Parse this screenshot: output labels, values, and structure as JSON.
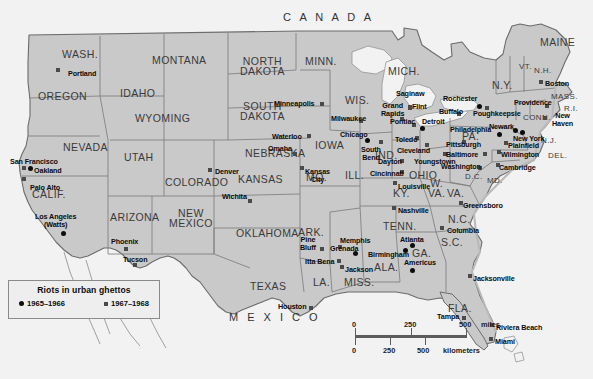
{
  "map": {
    "title": "Riots in urban ghettos",
    "width": 593,
    "height": 379,
    "background_color": "#f2f2f2",
    "land_color": "#c9c9c9",
    "water_color": "#f2f2f2",
    "border_color": "#6b6b6b",
    "countries": [
      {
        "name": "canada-label",
        "label": "C A N A D A",
        "x": 283,
        "y": 12
      },
      {
        "name": "mexico-label",
        "label": "M E X I C O",
        "x": 229,
        "y": 312
      }
    ],
    "states": [
      {
        "label": "WASH.",
        "x": 62,
        "y": 49,
        "size": "big"
      },
      {
        "label": "OREGON",
        "x": 38,
        "y": 91,
        "size": "big"
      },
      {
        "label": "IDAHO",
        "x": 120,
        "y": 88,
        "size": "big"
      },
      {
        "label": "MONTANA",
        "x": 152,
        "y": 55,
        "size": "big"
      },
      {
        "label": "NORTH\nDAKOTA",
        "x": 240,
        "y": 56,
        "size": "big"
      },
      {
        "label": "SOUTH\nDAKOTA",
        "x": 240,
        "y": 101,
        "size": "big"
      },
      {
        "label": "MINN.",
        "x": 305,
        "y": 56,
        "size": "big"
      },
      {
        "label": "WYOMING",
        "x": 135,
        "y": 113,
        "size": "big"
      },
      {
        "label": "NEVADA",
        "x": 63,
        "y": 142,
        "size": "big"
      },
      {
        "label": "UTAH",
        "x": 124,
        "y": 152,
        "size": "big"
      },
      {
        "label": "COLORADO",
        "x": 165,
        "y": 177,
        "size": "big"
      },
      {
        "label": "NEBRASKA",
        "x": 245,
        "y": 148,
        "size": "big"
      },
      {
        "label": "IOWA",
        "x": 315,
        "y": 140,
        "size": "big"
      },
      {
        "label": "WIS.",
        "x": 345,
        "y": 95,
        "size": "big"
      },
      {
        "label": "MICH.",
        "x": 388,
        "y": 66,
        "size": "big"
      },
      {
        "label": "CALIF.",
        "x": 32,
        "y": 189,
        "size": "big"
      },
      {
        "label": "ARIZONA",
        "x": 110,
        "y": 212,
        "size": "big"
      },
      {
        "label": "NEW\nMEXICO",
        "x": 169,
        "y": 208,
        "size": "big"
      },
      {
        "label": "KANSAS",
        "x": 238,
        "y": 174,
        "size": "big"
      },
      {
        "label": "MO.",
        "x": 306,
        "y": 172,
        "size": "big"
      },
      {
        "label": "ILL.",
        "x": 345,
        "y": 170,
        "size": "big"
      },
      {
        "label": "IND.",
        "x": 375,
        "y": 150,
        "size": "big"
      },
      {
        "label": "OHIO",
        "x": 409,
        "y": 170,
        "size": "big"
      },
      {
        "label": "KY.",
        "x": 393,
        "y": 188,
        "size": "big"
      },
      {
        "label": "OKLAHOMA",
        "x": 236,
        "y": 228,
        "size": "big"
      },
      {
        "label": "ARK.",
        "x": 298,
        "y": 227,
        "size": "big"
      },
      {
        "label": "TENN.",
        "x": 383,
        "y": 221,
        "size": "big"
      },
      {
        "label": "TEXAS",
        "x": 250,
        "y": 281,
        "size": "big"
      },
      {
        "label": "LA.",
        "x": 313,
        "y": 277,
        "size": "big"
      },
      {
        "label": "MISS.",
        "x": 344,
        "y": 277,
        "size": "big"
      },
      {
        "label": "ALA.",
        "x": 374,
        "y": 262,
        "size": "big"
      },
      {
        "label": "GA.",
        "x": 412,
        "y": 248,
        "size": "big"
      },
      {
        "label": "FLA.",
        "x": 448,
        "y": 303,
        "size": "big"
      },
      {
        "label": "S.C.",
        "x": 441,
        "y": 237,
        "size": "big"
      },
      {
        "label": "N.C.",
        "x": 448,
        "y": 214,
        "size": "big"
      },
      {
        "label": "VA.",
        "x": 447,
        "y": 188,
        "size": "big"
      },
      {
        "label": "W.\nVA.",
        "x": 428,
        "y": 178,
        "size": "big"
      },
      {
        "label": "PA.",
        "x": 462,
        "y": 131,
        "size": "big"
      },
      {
        "label": "N.Y.",
        "x": 492,
        "y": 80,
        "size": "big"
      },
      {
        "label": "MAINE",
        "x": 540,
        "y": 37,
        "size": "big"
      },
      {
        "label": "VT.",
        "x": 519,
        "y": 62,
        "size": "sm"
      },
      {
        "label": "N.H.",
        "x": 534,
        "y": 66,
        "size": "sm"
      },
      {
        "label": "MASS.",
        "x": 551,
        "y": 92,
        "size": "sm"
      },
      {
        "label": "R.I.",
        "x": 564,
        "y": 104,
        "size": "sm"
      },
      {
        "label": "CONN.",
        "x": 523,
        "y": 113,
        "size": "sm"
      },
      {
        "label": "N.J.",
        "x": 541,
        "y": 136,
        "size": "sm"
      },
      {
        "label": "DEL.",
        "x": 548,
        "y": 151,
        "size": "sm"
      },
      {
        "label": "MD.",
        "x": 487,
        "y": 176,
        "size": "sm"
      },
      {
        "label": "D.C.",
        "x": 465,
        "y": 172,
        "size": "sm"
      }
    ],
    "cities": [
      {
        "name": "portland",
        "label": "Portland",
        "x": 68,
        "y": 70,
        "mx": 56,
        "my": 68,
        "marker": "sq",
        "label_pos": "right"
      },
      {
        "name": "san-francisco",
        "label": "San Francisco",
        "x": 10,
        "y": 158,
        "mx": 22,
        "my": 166,
        "marker": "sq",
        "label_pos": "above"
      },
      {
        "name": "oakland",
        "label": "Oakland",
        "x": 34,
        "y": 167,
        "mx": 28,
        "my": 166,
        "marker": "dot",
        "label_pos": "right"
      },
      {
        "name": "palo-alto",
        "label": "Palo Alto",
        "x": 30,
        "y": 184,
        "mx": 22,
        "my": 177,
        "marker": "sq",
        "label_pos": "right"
      },
      {
        "name": "los-angeles-watts",
        "label": "Los Angeles\n(Watts)",
        "x": 35,
        "y": 213,
        "mx": 61,
        "my": 231,
        "marker": "dot",
        "label_pos": "above"
      },
      {
        "name": "phoenix",
        "label": "Phoenix",
        "x": 111,
        "y": 238,
        "mx": 124,
        "my": 247,
        "marker": "sq",
        "label_pos": "above"
      },
      {
        "name": "tucson",
        "label": "Tucson",
        "x": 123,
        "y": 256,
        "mx": 133,
        "my": 263,
        "marker": "sq",
        "label_pos": "above"
      },
      {
        "name": "denver",
        "label": "Denver",
        "x": 215,
        "y": 168,
        "mx": 208,
        "my": 168,
        "marker": "sq",
        "label_pos": "right"
      },
      {
        "name": "minneapolis",
        "label": "Minneapolis",
        "x": 274,
        "y": 100,
        "mx": 320,
        "my": 102,
        "marker": "sq",
        "label_pos": "right"
      },
      {
        "name": "omaha",
        "label": "Omaha",
        "x": 268,
        "y": 145,
        "mx": 293,
        "my": 152,
        "marker": "sq",
        "label_pos": "above"
      },
      {
        "name": "waterloo",
        "label": "Waterloo",
        "x": 272,
        "y": 133,
        "mx": 307,
        "my": 134,
        "marker": "sq",
        "label_pos": "right"
      },
      {
        "name": "wichita",
        "label": "Wichita",
        "x": 222,
        "y": 193,
        "mx": 248,
        "my": 199,
        "marker": "sq",
        "label_pos": "above"
      },
      {
        "name": "kansas-city",
        "label": "Kansas\nCity",
        "x": 305,
        "y": 168,
        "mx": 300,
        "my": 166,
        "marker": "sq",
        "label_pos": "right"
      },
      {
        "name": "milwaukee",
        "label": "Milwaukee",
        "x": 331,
        "y": 115,
        "mx": 359,
        "my": 119,
        "marker": "sq",
        "label_pos": "above"
      },
      {
        "name": "chicago",
        "label": "Chicago",
        "x": 340,
        "y": 131,
        "mx": 365,
        "my": 138,
        "marker": "dot",
        "label_pos": "left"
      },
      {
        "name": "south-bend",
        "label": "South\nBend",
        "x": 361,
        "y": 146,
        "mx": 379,
        "my": 140,
        "marker": "sq",
        "label_pos": "right"
      },
      {
        "name": "grand-rapids",
        "label": "Grand\nRapids",
        "x": 381,
        "y": 102,
        "mx": 400,
        "my": 117,
        "marker": "sq",
        "label_pos": "above"
      },
      {
        "name": "saginaw",
        "label": "Saginaw",
        "x": 396,
        "y": 90,
        "mx": 408,
        "my": 106,
        "marker": "sq",
        "label_pos": "above"
      },
      {
        "name": "flint",
        "label": "Flint",
        "x": 412,
        "y": 103,
        "mx": 408,
        "my": 105,
        "marker": "sq",
        "label_pos": "right"
      },
      {
        "name": "pontiac",
        "label": "Pontiac",
        "x": 390,
        "y": 118,
        "mx": 412,
        "my": 123,
        "marker": "sq",
        "label_pos": "above"
      },
      {
        "name": "detroit",
        "label": "Detroit",
        "x": 422,
        "y": 118,
        "mx": 420,
        "my": 126,
        "marker": "dot",
        "label_pos": "right"
      },
      {
        "name": "toledo",
        "label": "Toledo",
        "x": 395,
        "y": 136,
        "mx": 415,
        "my": 136,
        "marker": "sq",
        "label_pos": "left"
      },
      {
        "name": "cleveland",
        "label": "Cleveland",
        "x": 397,
        "y": 147,
        "mx": 425,
        "my": 143,
        "marker": "sq",
        "label_pos": "right"
      },
      {
        "name": "dayton",
        "label": "Dayton",
        "x": 378,
        "y": 158,
        "mx": 400,
        "my": 159,
        "marker": "sq",
        "label_pos": "left"
      },
      {
        "name": "cincinnati",
        "label": "Cincinnati",
        "x": 370,
        "y": 170,
        "mx": 400,
        "my": 170,
        "marker": "sq",
        "label_pos": "left"
      },
      {
        "name": "youngstown",
        "label": "Youngstown",
        "x": 414,
        "y": 158,
        "mx": 443,
        "my": 152,
        "marker": "sq",
        "label_pos": "right"
      },
      {
        "name": "louisville",
        "label": "Louisville",
        "x": 398,
        "y": 183,
        "mx": 393,
        "my": 181,
        "marker": "sq",
        "label_pos": "right"
      },
      {
        "name": "buffalo",
        "label": "Buffalo",
        "x": 439,
        "y": 108,
        "mx": 457,
        "my": 112,
        "marker": "sq",
        "label_pos": "right"
      },
      {
        "name": "rochester",
        "label": "Rochester",
        "x": 443,
        "y": 95,
        "mx": 477,
        "my": 104,
        "marker": "dot",
        "label_pos": "above"
      },
      {
        "name": "poughkeepsie",
        "label": "Poughkeepsie",
        "x": 473,
        "y": 110,
        "mx": 485,
        "my": 106,
        "marker": "sq",
        "label_pos": "right"
      },
      {
        "name": "pittsburgh",
        "label": "Pittsburgh",
        "x": 446,
        "y": 141,
        "mx": 462,
        "my": 140,
        "marker": "sq",
        "label_pos": "right"
      },
      {
        "name": "philadelphia",
        "label": "Philadelphia",
        "x": 450,
        "y": 126,
        "mx": 497,
        "my": 132,
        "marker": "dot",
        "label_pos": "right"
      },
      {
        "name": "baltimore",
        "label": "Baltimore",
        "x": 446,
        "y": 151,
        "mx": 483,
        "my": 152,
        "marker": "sq",
        "label_pos": "right"
      },
      {
        "name": "washington-dc",
        "label": "Washington",
        "x": 441,
        "y": 163,
        "mx": 478,
        "my": 166,
        "marker": "sq",
        "label_pos": "right"
      },
      {
        "name": "newark",
        "label": "Newark",
        "x": 489,
        "y": 123,
        "mx": 513,
        "my": 128,
        "marker": "dot",
        "label_pos": "above"
      },
      {
        "name": "plainfield",
        "label": "Plainfield",
        "x": 508,
        "y": 142,
        "mx": 504,
        "my": 141,
        "marker": "sq",
        "label_pos": "right"
      },
      {
        "name": "new-york",
        "label": "New York",
        "x": 513,
        "y": 135,
        "mx": 520,
        "my": 130,
        "marker": "dot",
        "label_pos": "right"
      },
      {
        "name": "wilmington",
        "label": "Wilmington",
        "x": 501,
        "y": 151,
        "mx": 497,
        "my": 150,
        "marker": "sq",
        "label_pos": "right"
      },
      {
        "name": "cambridge",
        "label": "Cambridge",
        "x": 499,
        "y": 164,
        "mx": 496,
        "my": 163,
        "marker": "sq",
        "label_pos": "right"
      },
      {
        "name": "providence",
        "label": "Providence",
        "x": 514,
        "y": 99,
        "mx": 545,
        "my": 104,
        "marker": "sq",
        "label_pos": "right"
      },
      {
        "name": "boston",
        "label": "Boston",
        "x": 545,
        "y": 80,
        "mx": 539,
        "my": 80,
        "marker": "sq",
        "label_pos": "right"
      },
      {
        "name": "new-haven",
        "label": "New\nHaven",
        "x": 552,
        "y": 112,
        "mx": 543,
        "my": 116,
        "marker": "sq",
        "label_pos": "right"
      },
      {
        "name": "greensboro",
        "label": "Greensboro",
        "x": 463,
        "y": 202,
        "mx": 459,
        "my": 201,
        "marker": "sq",
        "label_pos": "right"
      },
      {
        "name": "columbia",
        "label": "Columbia",
        "x": 447,
        "y": 227,
        "mx": 440,
        "my": 226,
        "marker": "sq",
        "label_pos": "right"
      },
      {
        "name": "nashville",
        "label": "Nashville",
        "x": 398,
        "y": 207,
        "mx": 392,
        "my": 206,
        "marker": "sq",
        "label_pos": "right"
      },
      {
        "name": "memphis",
        "label": "Memphis",
        "x": 340,
        "y": 237,
        "mx": 338,
        "my": 245,
        "marker": "sq",
        "label_pos": "above"
      },
      {
        "name": "grenada",
        "label": "Grenada",
        "x": 330,
        "y": 245,
        "mx": 353,
        "my": 251,
        "marker": "dot",
        "label_pos": "left"
      },
      {
        "name": "pine-bluff",
        "label": "Pine\nBluff",
        "x": 300,
        "y": 236,
        "mx": 320,
        "my": 247,
        "marker": "sq",
        "label_pos": "above"
      },
      {
        "name": "itta-bena",
        "label": "Itta Bena",
        "x": 305,
        "y": 258,
        "mx": 337,
        "my": 259,
        "marker": "sq",
        "label_pos": "right"
      },
      {
        "name": "jackson",
        "label": "Jackson",
        "x": 345,
        "y": 266,
        "mx": 340,
        "my": 265,
        "marker": "sq",
        "label_pos": "right"
      },
      {
        "name": "birmingham",
        "label": "Birmingham",
        "x": 368,
        "y": 251,
        "mx": 403,
        "my": 248,
        "marker": "dot",
        "label_pos": "right"
      },
      {
        "name": "atlanta",
        "label": "Atlanta",
        "x": 400,
        "y": 236,
        "mx": 410,
        "my": 243,
        "marker": "dot",
        "label_pos": "above"
      },
      {
        "name": "americus",
        "label": "Americus",
        "x": 404,
        "y": 259,
        "mx": 410,
        "my": 268,
        "marker": "dot",
        "label_pos": "above"
      },
      {
        "name": "jacksonville",
        "label": "Jacksonville",
        "x": 473,
        "y": 275,
        "mx": 468,
        "my": 274,
        "marker": "sq",
        "label_pos": "right"
      },
      {
        "name": "tampa",
        "label": "Tampa",
        "x": 437,
        "y": 313,
        "mx": 462,
        "my": 316,
        "marker": "sq",
        "label_pos": "left"
      },
      {
        "name": "riviera-beach",
        "label": "Riviera Beach",
        "x": 496,
        "y": 324,
        "mx": 490,
        "my": 323,
        "marker": "sq",
        "label_pos": "right"
      },
      {
        "name": "miami",
        "label": "Miami",
        "x": 495,
        "y": 338,
        "mx": 489,
        "my": 337,
        "marker": "sq",
        "label_pos": "right"
      },
      {
        "name": "houston",
        "label": "Houston",
        "x": 278,
        "y": 303,
        "mx": 309,
        "my": 306,
        "marker": "sq",
        "label_pos": "right"
      }
    ],
    "legend": {
      "title": "Riots in urban ghettos",
      "items": [
        {
          "name": "legend-1965-1966",
          "marker": "dot",
          "label": "1965–1966"
        },
        {
          "name": "legend-1967-1968",
          "marker": "sq",
          "label": "1967–1968"
        }
      ]
    },
    "scale": {
      "miles": {
        "ticks": [
          "0",
          "250",
          "500"
        ],
        "unit": "miles"
      },
      "kilometers": {
        "ticks": [
          "0",
          "250",
          "500"
        ],
        "unit": "kilometers"
      }
    }
  }
}
